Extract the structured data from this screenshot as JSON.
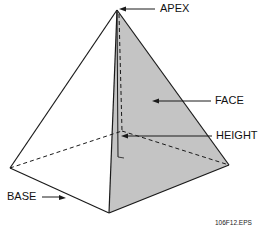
{
  "diagram": {
    "type": "pyramid",
    "labels": {
      "apex": "APEX",
      "face": "FACE",
      "height": "HEIGHT",
      "base": "BASE"
    },
    "caption": "106F12.EPS",
    "colors": {
      "face_fill": "#c4c4c4",
      "line": "#1a1a1a",
      "background": "#ffffff"
    }
  }
}
